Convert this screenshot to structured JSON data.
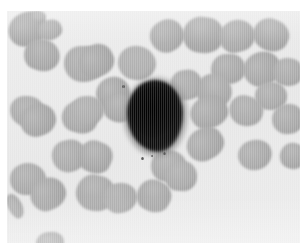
{
  "image": {
    "kind": "micrograph",
    "subject": "peripheral-blood-smear",
    "canvas_width": 306,
    "canvas_height": 249,
    "frame": {
      "x": 7,
      "y": 11,
      "width": 293,
      "height": 232
    },
    "page_background": "#ffffff",
    "plasma_background": "#ececec",
    "plasma_background_alt": "#e6e6e6"
  },
  "palette": {
    "rbc_fill": "#a9a9a9",
    "rbc_fill_light": "#b4b4b4",
    "rbc_fill_dark": "#9b9b9b",
    "rbc_edge": "#bdbdbd",
    "wbc_core": "#0d0d0d",
    "wbc_rim": "#3a3a3a",
    "wbc_halo": "#8e8e8e",
    "speck": "#5a5a5a"
  },
  "white_blood_cell": {
    "label": "stained-leukocyte",
    "x": 127,
    "y": 80,
    "width": 56,
    "height": 72,
    "core_color": "#0d0d0d",
    "rim_color": "#3a3a3a",
    "halo_color": "#8e8e8e"
  },
  "specks": [
    {
      "x": 122,
      "y": 85,
      "size": 3
    },
    {
      "x": 141,
      "y": 157,
      "size": 3
    },
    {
      "x": 151,
      "y": 155,
      "size": 2
    },
    {
      "x": 163,
      "y": 152,
      "size": 3
    }
  ],
  "red_blood_cells": [
    {
      "x": 8,
      "y": 12,
      "w": 40,
      "h": 34,
      "tone": "#a4a4a4"
    },
    {
      "x": 32,
      "y": 11,
      "w": 14,
      "h": 10,
      "tone": "#b0b0b0"
    },
    {
      "x": 38,
      "y": 20,
      "w": 24,
      "h": 20,
      "tone": "#aaaaaa"
    },
    {
      "x": 24,
      "y": 39,
      "w": 36,
      "h": 32,
      "tone": "#a7a7a7"
    },
    {
      "x": 64,
      "y": 46,
      "w": 40,
      "h": 36,
      "tone": "#a9a9a9"
    },
    {
      "x": 78,
      "y": 45,
      "w": 36,
      "h": 32,
      "tone": "#a5a5a5"
    },
    {
      "x": 118,
      "y": 46,
      "w": 38,
      "h": 34,
      "tone": "#aeaeae"
    },
    {
      "x": 96,
      "y": 77,
      "w": 34,
      "h": 32,
      "tone": "#a3a3a3"
    },
    {
      "x": 103,
      "y": 94,
      "w": 30,
      "h": 28,
      "tone": "#a6a6a6"
    },
    {
      "x": 10,
      "y": 96,
      "w": 34,
      "h": 30,
      "tone": "#a9a9a9"
    },
    {
      "x": 20,
      "y": 104,
      "w": 36,
      "h": 32,
      "tone": "#a4a4a4"
    },
    {
      "x": 62,
      "y": 101,
      "w": 36,
      "h": 32,
      "tone": "#a8a8a8"
    },
    {
      "x": 70,
      "y": 96,
      "w": 34,
      "h": 30,
      "tone": "#acacac"
    },
    {
      "x": 150,
      "y": 20,
      "w": 34,
      "h": 32,
      "tone": "#a8a8a8"
    },
    {
      "x": 183,
      "y": 17,
      "w": 40,
      "h": 36,
      "tone": "#a5a5a5"
    },
    {
      "x": 219,
      "y": 20,
      "w": 36,
      "h": 32,
      "tone": "#a8a8a8"
    },
    {
      "x": 253,
      "y": 19,
      "w": 36,
      "h": 32,
      "tone": "#a6a6a6"
    },
    {
      "x": 211,
      "y": 54,
      "w": 34,
      "h": 30,
      "tone": "#a7a7a7"
    },
    {
      "x": 243,
      "y": 52,
      "w": 38,
      "h": 34,
      "tone": "#a4a4a4"
    },
    {
      "x": 273,
      "y": 58,
      "w": 30,
      "h": 28,
      "tone": "#a9a9a9"
    },
    {
      "x": 170,
      "y": 70,
      "w": 32,
      "h": 30,
      "tone": "#aaaaaa"
    },
    {
      "x": 196,
      "y": 74,
      "w": 36,
      "h": 34,
      "tone": "#a6a6a6"
    },
    {
      "x": 255,
      "y": 82,
      "w": 32,
      "h": 28,
      "tone": "#a8a8a8"
    },
    {
      "x": 190,
      "y": 96,
      "w": 38,
      "h": 32,
      "tone": "#a5a5a5"
    },
    {
      "x": 229,
      "y": 96,
      "w": 34,
      "h": 30,
      "tone": "#a9a9a9"
    },
    {
      "x": 272,
      "y": 104,
      "w": 32,
      "h": 30,
      "tone": "#a7a7a7"
    },
    {
      "x": 186,
      "y": 128,
      "w": 38,
      "h": 32,
      "tone": "#a6a6a6"
    },
    {
      "x": 151,
      "y": 150,
      "w": 36,
      "h": 32,
      "tone": "#a8a8a8"
    },
    {
      "x": 52,
      "y": 140,
      "w": 34,
      "h": 32,
      "tone": "#a9a9a9"
    },
    {
      "x": 78,
      "y": 141,
      "w": 34,
      "h": 32,
      "tone": "#a5a5a5"
    },
    {
      "x": 10,
      "y": 163,
      "w": 36,
      "h": 32,
      "tone": "#a8a8a8"
    },
    {
      "x": 30,
      "y": 178,
      "w": 36,
      "h": 32,
      "tone": "#a4a4a4"
    },
    {
      "x": 76,
      "y": 175,
      "w": 38,
      "h": 36,
      "tone": "#a7a7a7"
    },
    {
      "x": 103,
      "y": 183,
      "w": 34,
      "h": 30,
      "tone": "#aaaaaa"
    },
    {
      "x": 137,
      "y": 180,
      "w": 34,
      "h": 32,
      "tone": "#a5a5a5"
    },
    {
      "x": 165,
      "y": 161,
      "w": 32,
      "h": 30,
      "tone": "#a9a9a9"
    },
    {
      "x": 238,
      "y": 140,
      "w": 34,
      "h": 30,
      "tone": "#a8a8a8"
    },
    {
      "x": 280,
      "y": 143,
      "w": 26,
      "h": 26,
      "tone": "#a6a6a6"
    },
    {
      "x": 36,
      "y": 232,
      "w": 28,
      "h": 22,
      "tone": "#a5a5a5"
    },
    {
      "x": 8,
      "y": 193,
      "w": 14,
      "h": 26,
      "tone": "#a9a9a9"
    }
  ]
}
